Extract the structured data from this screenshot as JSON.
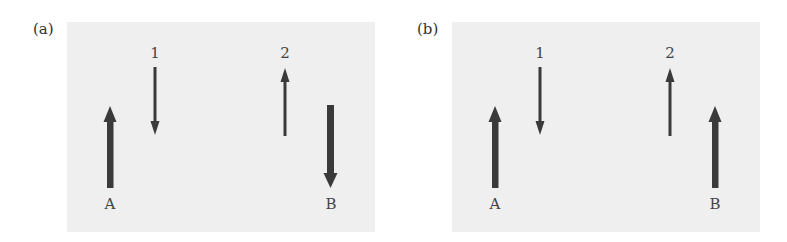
{
  "panels": [
    {
      "id": "a",
      "label": "(a)",
      "arrows": [
        {
          "name": "A",
          "label": "A",
          "direction": "up",
          "weight": "thick"
        },
        {
          "name": "1",
          "label": "1",
          "direction": "down",
          "weight": "thin"
        },
        {
          "name": "2",
          "label": "2",
          "direction": "up",
          "weight": "thin"
        },
        {
          "name": "B",
          "label": "B",
          "direction": "down",
          "weight": "thick"
        }
      ]
    },
    {
      "id": "b",
      "label": "(b)",
      "arrows": [
        {
          "name": "A",
          "label": "A",
          "direction": "up",
          "weight": "thick"
        },
        {
          "name": "1",
          "label": "1",
          "direction": "down",
          "weight": "thin"
        },
        {
          "name": "2",
          "label": "2",
          "direction": "up",
          "weight": "thin"
        },
        {
          "name": "B",
          "label": "B",
          "direction": "up",
          "weight": "thick"
        }
      ]
    }
  ],
  "colors": {
    "panel_bg": "#efefef",
    "arrow": "#3a3a3a"
  }
}
